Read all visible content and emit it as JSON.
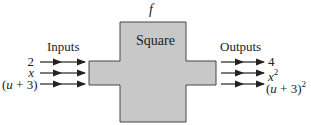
{
  "function": {
    "name": "f",
    "label": "Square",
    "fill_color": "#c8c8c8",
    "stroke_color": "#444444"
  },
  "inputs": {
    "heading": "Inputs",
    "items": [
      {
        "text": "2"
      },
      {
        "text": "x"
      },
      {
        "text": "(u + 3)"
      }
    ]
  },
  "outputs": {
    "heading": "Outputs",
    "items": [
      {
        "base": "4",
        "exp": ""
      },
      {
        "base": "x",
        "exp": "2"
      },
      {
        "base": "(u + 3)",
        "exp": "2"
      }
    ]
  }
}
